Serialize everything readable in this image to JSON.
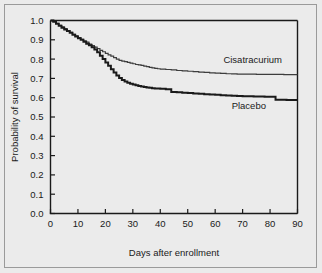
{
  "chart_data": {
    "type": "line",
    "subtype": "kaplan-meier-survival",
    "title": "",
    "xlabel": "Days after enrollment",
    "ylabel": "Probability of survival",
    "xlim": [
      0,
      90
    ],
    "ylim": [
      0.0,
      1.0
    ],
    "xticks": [
      0,
      10,
      20,
      30,
      40,
      50,
      60,
      70,
      80,
      90
    ],
    "xtick_labels": [
      "0",
      "10",
      "20",
      "30",
      "40",
      "50",
      "60",
      "70",
      "80",
      "90"
    ],
    "yticks": [
      0.0,
      0.1,
      0.2,
      0.3,
      0.4,
      0.5,
      0.6,
      0.7,
      0.8,
      0.9,
      1.0
    ],
    "ytick_labels": [
      "0.0",
      "0.1",
      "0.2",
      "0.3",
      "0.4",
      "0.5",
      "0.6",
      "0.7",
      "0.8",
      "0.9",
      "1.0"
    ],
    "grid": false,
    "legend_position": "inline-annotation",
    "series": [
      {
        "name": "Cisatracurium",
        "color": "#3d3d3d",
        "line_width": 1.2,
        "label_x": 63,
        "label_y": 0.78,
        "points": [
          [
            0,
            1.0
          ],
          [
            1,
            0.995
          ],
          [
            2,
            0.985
          ],
          [
            3,
            0.975
          ],
          [
            4,
            0.967
          ],
          [
            5,
            0.958
          ],
          [
            6,
            0.948
          ],
          [
            7,
            0.938
          ],
          [
            8,
            0.928
          ],
          [
            9,
            0.92
          ],
          [
            10,
            0.912
          ],
          [
            11,
            0.902
          ],
          [
            12,
            0.895
          ],
          [
            13,
            0.888
          ],
          [
            14,
            0.878
          ],
          [
            15,
            0.87
          ],
          [
            16,
            0.862
          ],
          [
            17,
            0.855
          ],
          [
            18,
            0.845
          ],
          [
            19,
            0.838
          ],
          [
            20,
            0.83
          ],
          [
            21,
            0.822
          ],
          [
            22,
            0.815
          ],
          [
            23,
            0.808
          ],
          [
            24,
            0.8
          ],
          [
            25,
            0.793
          ],
          [
            26,
            0.79
          ],
          [
            27,
            0.787
          ],
          [
            28,
            0.783
          ],
          [
            29,
            0.779
          ],
          [
            30,
            0.776
          ],
          [
            31,
            0.772
          ],
          [
            32,
            0.77
          ],
          [
            33,
            0.768
          ],
          [
            34,
            0.764
          ],
          [
            35,
            0.761
          ],
          [
            36,
            0.757
          ],
          [
            37,
            0.755
          ],
          [
            38,
            0.752
          ],
          [
            39,
            0.75
          ],
          [
            40,
            0.748
          ],
          [
            42,
            0.746
          ],
          [
            44,
            0.744
          ],
          [
            46,
            0.741
          ],
          [
            48,
            0.739
          ],
          [
            50,
            0.737
          ],
          [
            52,
            0.735
          ],
          [
            54,
            0.733
          ],
          [
            56,
            0.731
          ],
          [
            58,
            0.729
          ],
          [
            60,
            0.727
          ],
          [
            62,
            0.726
          ],
          [
            64,
            0.724
          ],
          [
            66,
            0.723
          ],
          [
            68,
            0.722
          ],
          [
            70,
            0.722
          ],
          [
            75,
            0.721
          ],
          [
            80,
            0.721
          ],
          [
            85,
            0.72
          ],
          [
            90,
            0.72
          ]
        ]
      },
      {
        "name": "Placebo",
        "color": "#1a1a1a",
        "line_width": 2.0,
        "label_x": 66,
        "label_y": 0.54,
        "points": [
          [
            0,
            1.0
          ],
          [
            1,
            0.993
          ],
          [
            2,
            0.983
          ],
          [
            3,
            0.973
          ],
          [
            4,
            0.963
          ],
          [
            5,
            0.954
          ],
          [
            6,
            0.945
          ],
          [
            7,
            0.936
          ],
          [
            8,
            0.926
          ],
          [
            9,
            0.917
          ],
          [
            10,
            0.908
          ],
          [
            11,
            0.9
          ],
          [
            12,
            0.89
          ],
          [
            13,
            0.88
          ],
          [
            14,
            0.872
          ],
          [
            15,
            0.862
          ],
          [
            16,
            0.85
          ],
          [
            17,
            0.835
          ],
          [
            18,
            0.818
          ],
          [
            19,
            0.8
          ],
          [
            20,
            0.782
          ],
          [
            21,
            0.765
          ],
          [
            22,
            0.748
          ],
          [
            23,
            0.73
          ],
          [
            24,
            0.715
          ],
          [
            25,
            0.702
          ],
          [
            26,
            0.692
          ],
          [
            27,
            0.684
          ],
          [
            28,
            0.678
          ],
          [
            29,
            0.672
          ],
          [
            30,
            0.668
          ],
          [
            31,
            0.664
          ],
          [
            32,
            0.661
          ],
          [
            33,
            0.658
          ],
          [
            34,
            0.656
          ],
          [
            35,
            0.653
          ],
          [
            36,
            0.651
          ],
          [
            37,
            0.649
          ],
          [
            38,
            0.648
          ],
          [
            40,
            0.646
          ],
          [
            42,
            0.644
          ],
          [
            44,
            0.63
          ],
          [
            46,
            0.628
          ],
          [
            48,
            0.626
          ],
          [
            50,
            0.624
          ],
          [
            52,
            0.622
          ],
          [
            54,
            0.62
          ],
          [
            56,
            0.618
          ],
          [
            58,
            0.617
          ],
          [
            60,
            0.615
          ],
          [
            62,
            0.613
          ],
          [
            64,
            0.612
          ],
          [
            66,
            0.61
          ],
          [
            68,
            0.609
          ],
          [
            70,
            0.607
          ],
          [
            74,
            0.606
          ],
          [
            78,
            0.605
          ],
          [
            82,
            0.59
          ],
          [
            86,
            0.588
          ],
          [
            90,
            0.588
          ]
        ]
      }
    ]
  }
}
